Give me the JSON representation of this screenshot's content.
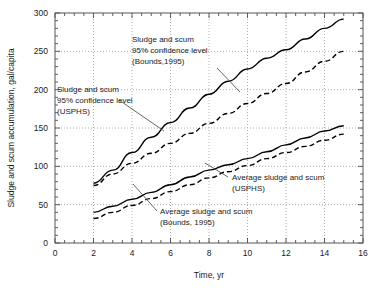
{
  "chart_data": {
    "type": "line",
    "title": "",
    "xlabel": "Time, yr",
    "ylabel": "Sludge and scum accumulation, gal/capita",
    "xlim": [
      0,
      16
    ],
    "ylim": [
      0,
      300
    ],
    "xticks": [
      "0",
      "2",
      "4",
      "6",
      "8",
      "10",
      "12",
      "14",
      "16"
    ],
    "yticks": [
      "0",
      "50",
      "100",
      "150",
      "200",
      "250",
      "300"
    ],
    "xtick_values": [
      0,
      2,
      4,
      6,
      8,
      10,
      12,
      14,
      16
    ],
    "ytick_values": [
      0,
      50,
      100,
      150,
      200,
      250,
      300
    ],
    "xminor_step": 0.5,
    "yminor_step": 10,
    "grid": "dotted, major gridlines both axes",
    "legend": "none; curves labeled by inline annotations with leader lines",
    "series": [
      {
        "name": "Sludge and scum 95% confidence level (Bounds, 1995)",
        "style": "solid",
        "x": [
          2,
          3,
          4,
          5,
          6,
          7,
          8,
          9,
          10,
          11,
          12,
          13,
          14,
          15
        ],
        "values": [
          78,
          95,
          118,
          138,
          157,
          176,
          194,
          211,
          227,
          241,
          252,
          266,
          280,
          292
        ]
      },
      {
        "name": "Sludge and scum 95% confidence level (USPHS)",
        "style": "dashed",
        "x": [
          2,
          3,
          4,
          5,
          6,
          7,
          8,
          9,
          10,
          11,
          12,
          13,
          14,
          15
        ],
        "values": [
          75,
          90,
          104,
          117,
          130,
          143,
          156,
          169,
          182,
          195,
          208,
          223,
          237,
          250
        ]
      },
      {
        "name": "Average sludge and scum (USPHS)",
        "style": "solid",
        "x": [
          2,
          3,
          4,
          5,
          6,
          7,
          8,
          9,
          10,
          11,
          12,
          13,
          14,
          15
        ],
        "values": [
          40,
          48,
          57,
          66,
          76,
          86,
          95,
          102,
          110,
          119,
          128,
          137,
          146,
          153
        ]
      },
      {
        "name": "Average sludge and scum (Bounds, 1995)",
        "style": "dashed",
        "x": [
          2,
          3,
          4,
          5,
          6,
          7,
          8,
          9,
          10,
          11,
          12,
          13,
          14,
          15
        ],
        "values": [
          32,
          40,
          49,
          58,
          67,
          76,
          85,
          93,
          101,
          110,
          118,
          126,
          134,
          142
        ]
      }
    ],
    "annotations": [
      {
        "id": "bounds-ci",
        "lines": [
          "Sludge and scum",
          "95% confidence level",
          "(Bounds,1995)"
        ],
        "points_to_series": "Sludge and scum 95% confidence level (Bounds, 1995)"
      },
      {
        "id": "usphs-ci",
        "lines": [
          "Sludge and scum",
          "95% confidence level",
          "(USPHS)"
        ],
        "points_to_series": "Sludge and scum 95% confidence level (USPHS)"
      },
      {
        "id": "usphs-avg",
        "lines": [
          "Average sludge and scum",
          "(USPHS)"
        ],
        "points_to_series": "Average sludge and scum (USPHS)"
      },
      {
        "id": "bounds-avg",
        "lines": [
          "Average sludge and scum",
          "(Bounds, 1995)"
        ],
        "points_to_series": "Average sludge and scum (Bounds, 1995)"
      }
    ],
    "colors": {
      "curve": "#000000",
      "grid": "#9a9a9a",
      "frame": "#444444",
      "text": "#1a1a1a",
      "background": "#ffffff"
    }
  }
}
